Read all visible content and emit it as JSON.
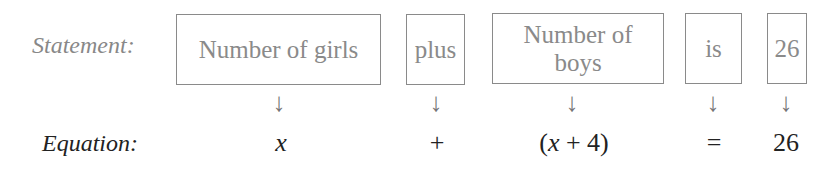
{
  "labels": {
    "statement": "Statement:",
    "equation": "Equation:"
  },
  "columns": [
    {
      "phrase": "Number of girls",
      "arrow": "↓",
      "term": "x"
    },
    {
      "phrase": "plus",
      "arrow": "↓",
      "term": "+"
    },
    {
      "phrase": "Number of boys",
      "arrow": "↓",
      "term": "(x + 4)"
    },
    {
      "phrase": "is",
      "arrow": "↓",
      "term": "="
    },
    {
      "phrase": "26",
      "arrow": "↓",
      "term": "26"
    }
  ],
  "term_parts": {
    "open_paren": "(",
    "var": "x",
    "rest": " + 4)"
  },
  "colors": {
    "statement_text": "#8a8a8a",
    "equation_text": "#222222"
  }
}
